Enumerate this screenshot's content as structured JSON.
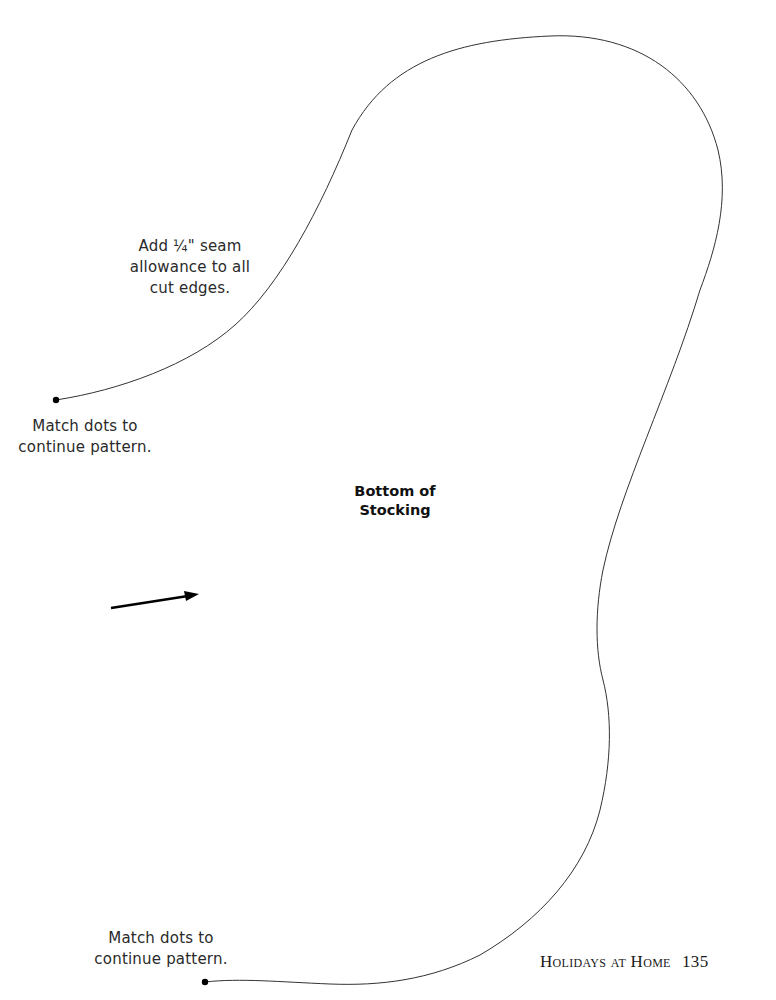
{
  "page": {
    "notes": {
      "seam_allowance": {
        "lines": [
          "Add ¼\" seam",
          "allowance to all",
          "cut edges."
        ]
      },
      "match_dots_top": {
        "lines": [
          "Match dots to",
          "continue pattern."
        ]
      },
      "match_dots_bottom": {
        "lines": [
          "Match dots to",
          "continue pattern."
        ]
      }
    },
    "piece_label": {
      "lines": [
        "Bottom of",
        "Stocking"
      ]
    },
    "footer": {
      "book_title": "Holidays at Home",
      "page_number": "135"
    },
    "icons": {
      "grainline_arrow": "arrow-right-icon",
      "match_dot": "dot-icon"
    },
    "colors": {
      "outline": "#333333",
      "dot": "#000000",
      "arrow": "#000000",
      "text": "#2a2a2a"
    }
  }
}
